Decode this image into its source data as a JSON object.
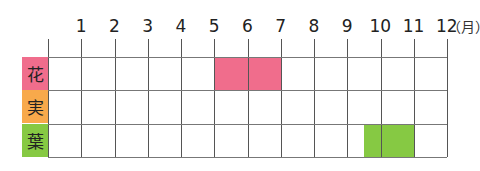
{
  "chart_data": {
    "type": "table",
    "title": "",
    "unit_label": "（月）",
    "months": [
      "1",
      "2",
      "3",
      "4",
      "5",
      "6",
      "7",
      "8",
      "9",
      "10",
      "11",
      "12"
    ],
    "rows": [
      {
        "label": "花",
        "color": "#f06d8c",
        "periods": [
          {
            "start": 6,
            "end": 7
          }
        ]
      },
      {
        "label": "実",
        "color": "#f8a94b",
        "periods": []
      },
      {
        "label": "葉",
        "color": "#86c943",
        "periods": [
          {
            "start": 10.5,
            "end": 11
          }
        ]
      }
    ],
    "grid": true
  }
}
